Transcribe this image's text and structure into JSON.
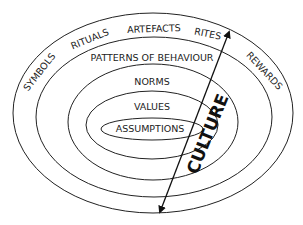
{
  "diagram": {
    "title": "CULTURE",
    "layers": [
      {
        "id": "outer",
        "label_items": [
          "SYMBOLS",
          "RITUALS",
          "ARTEFACTS",
          "RITES",
          "REWARDS"
        ]
      },
      {
        "id": "behaviour",
        "label": "PATTERNS OF BEHAVIOUR"
      },
      {
        "id": "norms",
        "label": "NORMS"
      },
      {
        "id": "values",
        "label": "VALUES"
      },
      {
        "id": "assumptions",
        "label": "ASSUMPTIONS"
      }
    ],
    "outer_labels": {
      "symbols": "SYMBOLS",
      "rituals": "RITUALS",
      "artefacts": "ARTEFACTS",
      "rites": "RITES",
      "rewards": "REWARDS"
    },
    "arrow": {
      "type": "double-headed",
      "label": "CULTURE"
    },
    "colors": {
      "stroke": "#222222",
      "background": "#ffffff"
    }
  }
}
